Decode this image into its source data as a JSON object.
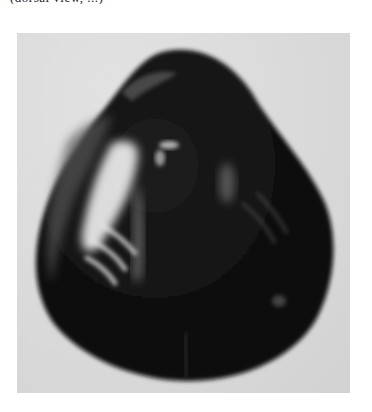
{
  "caption": {
    "text": "(dorsal view, ...)",
    "clipped": true
  },
  "photo": {
    "subject": "dark bivalve shell (mussel/clam)",
    "background_color": "#d9d9d9",
    "shell_color": "#121212",
    "highlight_color": "#f0f0f0"
  }
}
